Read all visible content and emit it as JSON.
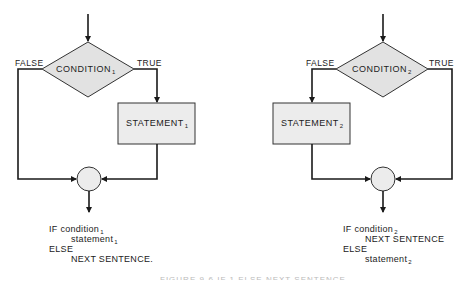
{
  "diagram": {
    "type": "flowchart",
    "colors": {
      "line": "#1a1a1a",
      "diamond_fill": "#e2e2e2",
      "box_fill": "#ececec",
      "circle_fill": "#ececec"
    },
    "left": {
      "condition": {
        "text": "CONDITION",
        "sub": "1"
      },
      "false_label": "FALSE",
      "true_label": "TRUE",
      "statement": {
        "text": "STATEMENT",
        "sub": "1"
      },
      "code": {
        "line1": {
          "text": "IF condition",
          "sub": "1"
        },
        "line2": {
          "text": "statement",
          "sub": "1"
        },
        "line3": {
          "text": "ELSE"
        },
        "line4": {
          "text": "NEXT SENTENCE."
        }
      }
    },
    "right": {
      "condition": {
        "text": "CONDITION",
        "sub": "2"
      },
      "false_label": "FALSE",
      "true_label": "TRUE",
      "statement": {
        "text": "STATEMENT",
        "sub": "2"
      },
      "code": {
        "line1": {
          "text": "IF condition",
          "sub": "2"
        },
        "line2": {
          "text": "NEXT SENTENCE"
        },
        "line3": {
          "text": "ELSE"
        },
        "line4": {
          "text": "statement",
          "sub": "2"
        }
      }
    },
    "caption": "FIGURE 9-6  IF 1 ELSE  NEXT SENTENCE"
  }
}
